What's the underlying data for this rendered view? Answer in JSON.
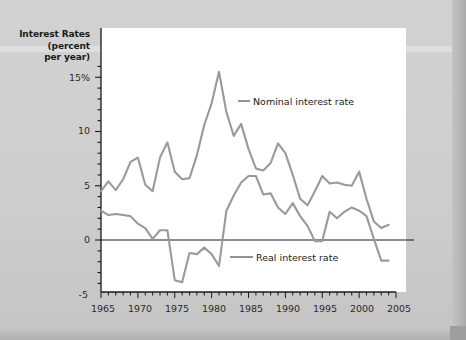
{
  "figure": {
    "axis_title_lines": [
      "Interest Rates",
      "(percent",
      "per year)"
    ],
    "line_color": "#9a9a9a",
    "axis_color": "#1a1a1a",
    "plot_background": "#ffffff",
    "page_background": "#cfcfcf"
  },
  "legend": {
    "nominal_label": "Nominal interest rate",
    "real_label": "Real interest rate"
  },
  "axes": {
    "y_ticks": [
      "15%",
      "10",
      "5",
      "0",
      "-5"
    ],
    "x_ticks": [
      "1965",
      "1970",
      "1975",
      "1980",
      "1985",
      "1990",
      "1995",
      "2000",
      "2005"
    ]
  },
  "chart_data": {
    "type": "line",
    "title": "",
    "xlabel": "",
    "ylabel": "Interest Rates (percent per year)",
    "xlim": [
      1965,
      2005
    ],
    "ylim": [
      -5,
      16.5
    ],
    "grid": false,
    "legend_position": "inline-annotation",
    "x": [
      1965,
      1966,
      1967,
      1968,
      1969,
      1970,
      1971,
      1972,
      1973,
      1974,
      1975,
      1976,
      1977,
      1978,
      1979,
      1980,
      1981,
      1982,
      1983,
      1984,
      1985,
      1986,
      1987,
      1988,
      1989,
      1990,
      1991,
      1992,
      1993,
      1994,
      1995,
      1996,
      1997,
      1998,
      1999,
      2000,
      2001,
      2002,
      2003,
      2004
    ],
    "series": [
      {
        "name": "Nominal interest rate",
        "values": [
          4.5,
          5.4,
          4.6,
          5.6,
          7.2,
          7.6,
          5.1,
          4.5,
          7.6,
          9.0,
          6.3,
          5.6,
          5.7,
          7.8,
          10.6,
          12.6,
          15.5,
          11.8,
          9.6,
          10.7,
          8.4,
          6.6,
          6.4,
          7.1,
          8.9,
          8.0,
          6.0,
          3.8,
          3.2,
          4.5,
          5.9,
          5.2,
          5.3,
          5.1,
          5.0,
          6.3,
          3.8,
          1.7,
          1.1,
          1.4
        ]
      },
      {
        "name": "Real interest rate",
        "values": [
          2.7,
          2.3,
          2.4,
          2.3,
          2.2,
          1.5,
          1.1,
          0.1,
          0.9,
          0.9,
          -3.7,
          -3.9,
          -1.2,
          -1.3,
          -0.7,
          -1.3,
          -2.4,
          2.7,
          4.1,
          5.3,
          5.9,
          5.9,
          4.2,
          4.3,
          3.0,
          2.4,
          3.4,
          2.2,
          1.3,
          -0.1,
          -0.1,
          2.6,
          2.0,
          2.6,
          3.0,
          2.7,
          2.2,
          0.1,
          -1.9,
          -1.9
        ]
      }
    ]
  }
}
